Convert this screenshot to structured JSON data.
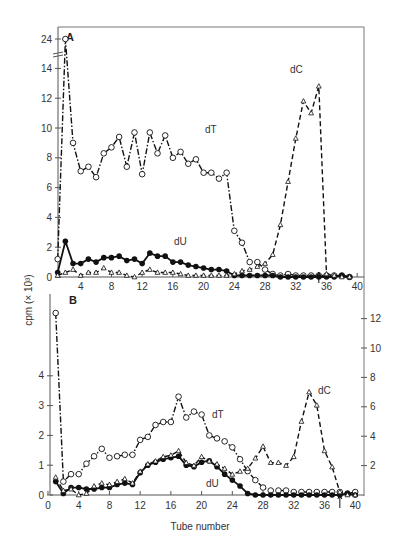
{
  "figure": {
    "xlabel": "Tube number",
    "ylabel": "cpm (× 10³)"
  },
  "chart_data": [
    {
      "type": "line",
      "panel": "A",
      "title": "A",
      "xlabel": "",
      "ylabel": "cpm (× 10³)",
      "xlim": [
        0,
        40
      ],
      "x_ticks": [
        4,
        8,
        12,
        16,
        20,
        24,
        28,
        32,
        36,
        40
      ],
      "y_ticks": [
        0,
        2,
        4,
        6,
        8,
        10,
        12,
        14,
        24
      ],
      "axis_break": "between 14 and 24",
      "annotations": [
        {
          "type": "arrow",
          "x": 35,
          "text": "↑"
        }
      ],
      "series": [
        {
          "name": "dT",
          "marker": "open-circle",
          "line": "dash-dot",
          "x": [
            1,
            2,
            3,
            4,
            5,
            6,
            7,
            8,
            9,
            10,
            11,
            12,
            13,
            14,
            15,
            16,
            17,
            18,
            19,
            20,
            21,
            22,
            23,
            24,
            25,
            26,
            27,
            28,
            29,
            30,
            31,
            32,
            33,
            34,
            35,
            36,
            37,
            38,
            39
          ],
          "values": [
            1.2,
            24,
            9.0,
            7.1,
            7.4,
            6.7,
            8.3,
            8.7,
            9.4,
            7.4,
            9.7,
            6.9,
            9.7,
            8.3,
            9.5,
            8.0,
            8.4,
            7.6,
            7.9,
            7.0,
            7.0,
            6.6,
            7.0,
            3.1,
            2.3,
            1.0,
            1.0,
            0.5,
            0.2,
            0.1,
            0.2,
            0.1,
            0.1,
            0.1,
            0.1,
            0.1,
            0.1,
            0.1,
            0.0
          ]
        },
        {
          "name": "dU",
          "marker": "filled-circle",
          "line": "solid",
          "x": [
            1,
            2,
            3,
            4,
            5,
            6,
            7,
            8,
            9,
            10,
            11,
            12,
            13,
            14,
            15,
            16,
            17,
            18,
            19,
            20,
            21,
            22,
            23,
            24,
            25,
            26,
            27,
            28,
            29,
            30,
            31,
            32,
            33,
            34,
            35,
            36,
            37,
            38,
            39
          ],
          "values": [
            0.3,
            2.4,
            0.9,
            0.9,
            1.2,
            1.0,
            1.3,
            1.3,
            1.4,
            1.1,
            1.2,
            0.9,
            1.6,
            1.4,
            1.4,
            1.0,
            1.0,
            0.8,
            0.7,
            0.6,
            0.5,
            0.5,
            0.4,
            0.1,
            0.1,
            0.1,
            0.1,
            0.1,
            0.1,
            0.0,
            0.0,
            0.0,
            0.0,
            0.0,
            0.0,
            0.0,
            0.0,
            0.1,
            0.0
          ]
        },
        {
          "name": "dC",
          "marker": "open-triangle",
          "line": "dashed",
          "x": [
            1,
            2,
            3,
            4,
            5,
            6,
            7,
            8,
            9,
            10,
            11,
            12,
            13,
            14,
            15,
            16,
            17,
            18,
            19,
            20,
            21,
            22,
            23,
            24,
            25,
            26,
            27,
            28,
            29,
            30,
            31,
            32,
            33,
            34,
            35,
            36,
            37,
            38,
            39
          ],
          "values": [
            0.1,
            0.3,
            0.5,
            0.1,
            0.3,
            0.3,
            0.6,
            0.3,
            0.3,
            0.1,
            0.0,
            0.3,
            0.5,
            0.3,
            0.3,
            0.3,
            0.2,
            0.1,
            0.1,
            0.1,
            0.1,
            0.1,
            0.1,
            0.2,
            0.4,
            0.5,
            0.7,
            0.9,
            1.5,
            3.5,
            6.4,
            9.3,
            11.8,
            11.0,
            12.8,
            0.2,
            0.1,
            0.0,
            0.0
          ]
        }
      ],
      "series_labels": [
        "dT",
        "dU",
        "dC"
      ]
    },
    {
      "type": "line",
      "panel": "B",
      "title": "B",
      "xlabel": "Tube number",
      "ylabel": "cpm (× 10³)",
      "xlim": [
        0,
        40
      ],
      "x_ticks": [
        0,
        4,
        8,
        12,
        16,
        20,
        24,
        28,
        32,
        36,
        40
      ],
      "y_ticks_left": [
        0,
        1,
        2,
        3,
        4
      ],
      "y_ticks_right": [
        2,
        4,
        6,
        8,
        10,
        12
      ],
      "left_axis_break": "above 4 (first dT point ≈ 12.5 off-scale)",
      "annotations": [
        {
          "type": "arrow",
          "x": 38,
          "text": "↑"
        }
      ],
      "series": [
        {
          "name": "dT",
          "marker": "open-circle",
          "line": "dash-dot",
          "axis": "left",
          "x": [
            1,
            2,
            3,
            4,
            5,
            6,
            7,
            8,
            9,
            10,
            11,
            12,
            13,
            14,
            15,
            16,
            17,
            18,
            19,
            20,
            21,
            22,
            23,
            24,
            25,
            26,
            27,
            28,
            29,
            30,
            31,
            32,
            33,
            34,
            35,
            36,
            37,
            38,
            39,
            40
          ],
          "values": [
            12.5,
            0.45,
            0.7,
            0.7,
            1.05,
            1.3,
            1.55,
            1.25,
            1.3,
            1.35,
            1.35,
            1.85,
            1.95,
            2.35,
            2.45,
            2.45,
            3.3,
            2.6,
            2.8,
            2.7,
            2.0,
            1.9,
            1.8,
            1.6,
            1.2,
            0.8,
            0.5,
            0.25,
            0.15,
            0.15,
            0.15,
            0.1,
            0.1,
            0.1,
            0.1,
            0.1,
            0.1,
            0.1,
            0.05,
            0.1
          ]
        },
        {
          "name": "dU",
          "marker": "filled-circle",
          "line": "solid",
          "axis": "left",
          "x": [
            1,
            2,
            3,
            4,
            5,
            6,
            7,
            8,
            9,
            10,
            11,
            12,
            13,
            14,
            15,
            16,
            17,
            18,
            19,
            20,
            21,
            22,
            23,
            24,
            25,
            26,
            27,
            28,
            29,
            30,
            31,
            32,
            33,
            34,
            35,
            36,
            37,
            38,
            39,
            40
          ],
          "values": [
            0.45,
            0.05,
            0.25,
            0.25,
            0.2,
            0.2,
            0.25,
            0.25,
            0.35,
            0.4,
            0.35,
            0.75,
            1.0,
            1.1,
            1.2,
            1.25,
            1.3,
            1.0,
            0.95,
            1.1,
            1.15,
            0.95,
            0.7,
            0.5,
            0.3,
            0.05,
            0.0,
            0.0,
            0.0,
            0.0,
            0.0,
            0.0,
            0.0,
            0.0,
            0.0,
            0.0,
            0.0,
            0.0,
            0.05,
            0.0
          ]
        },
        {
          "name": "dC",
          "marker": "open-triangle",
          "line": "dashed",
          "axis": "right",
          "x": [
            1,
            2,
            3,
            4,
            5,
            6,
            7,
            8,
            9,
            10,
            11,
            12,
            13,
            14,
            15,
            16,
            17,
            18,
            19,
            20,
            21,
            22,
            23,
            24,
            25,
            26,
            27,
            28,
            29,
            30,
            31,
            32,
            33,
            34,
            35,
            36,
            37,
            38,
            39,
            40
          ],
          "values": [
            1.2,
            0.3,
            0.4,
            0.0,
            0.1,
            0.6,
            0.8,
            0.7,
            0.9,
            1.1,
            0.8,
            1.6,
            2.1,
            2.3,
            2.6,
            2.7,
            3.0,
            2.2,
            2.0,
            2.6,
            2.3,
            2.1,
            1.8,
            1.4,
            1.6,
            1.8,
            2.5,
            3.3,
            2.2,
            2.2,
            2.0,
            2.6,
            5.0,
            7.0,
            6.1,
            3.0,
            1.9,
            0.2,
            0.0,
            0.0
          ]
        }
      ],
      "series_labels": [
        "dT",
        "dU",
        "dC"
      ]
    }
  ],
  "labels": {
    "panel_a": "A",
    "panel_b": "B",
    "dT": "dT",
    "dU": "dU",
    "dC": "dC",
    "tube_number": "Tube number",
    "cpm": "cpm (× 10³)",
    "arrow": "↑"
  }
}
